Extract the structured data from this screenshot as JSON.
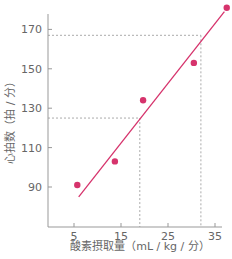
{
  "chart_data": {
    "type": "scatter",
    "title": "",
    "xlabel": "酸素摂取量（mL / kg / 分）",
    "ylabel": "心拍数（拍 / 分）",
    "x_ticks": [
      5,
      15,
      25,
      35
    ],
    "y_ticks": [
      90,
      110,
      130,
      150,
      170
    ],
    "xlim": [
      0,
      37.5
    ],
    "ylim": [
      70,
      180
    ],
    "grid": false,
    "legend": null,
    "series": [
      {
        "name": "measurements",
        "color": "#d6336c",
        "points": [
          {
            "x": 5.7,
            "y": 91
          },
          {
            "x": 13.7,
            "y": 103
          },
          {
            "x": 19.7,
            "y": 134
          },
          {
            "x": 30.5,
            "y": 153
          },
          {
            "x": 37.5,
            "y": 181
          }
        ]
      }
    ],
    "regression_line": {
      "color": "#d6336c",
      "from": {
        "x": 6,
        "y": 85
      },
      "to": {
        "x": 37,
        "y": 179
      }
    },
    "reference_lines": [
      {
        "style": "dashed",
        "hr": 125,
        "vo2": 19
      },
      {
        "style": "dashed",
        "hr": 167,
        "vo2": 32
      }
    ]
  },
  "axis_color": "#999999",
  "dashed_color": "#aaaaaa"
}
